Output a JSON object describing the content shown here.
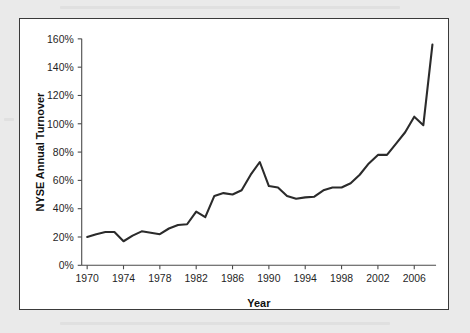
{
  "figure": {
    "background_color": "#ffffff",
    "page_background_color": "#eaeaea",
    "border_color": "#3a3a3a"
  },
  "chart_data": {
    "type": "line",
    "title": "",
    "xlabel": "Year",
    "ylabel": "NYSE Annual Turnover",
    "xlim": [
      1969.4,
      2008.4
    ],
    "ylim": [
      0,
      160
    ],
    "grid": false,
    "legend": null,
    "series_color": "#2b2b2b",
    "series_width": 2.1,
    "y_ticks": [
      0,
      20,
      40,
      60,
      80,
      100,
      120,
      140,
      160
    ],
    "y_tick_labels": [
      "0%",
      "20%",
      "40%",
      "60%",
      "80%",
      "100%",
      "120%",
      "140%",
      "160%"
    ],
    "x_ticks": [
      1970,
      1974,
      1978,
      1982,
      1986,
      1990,
      1994,
      1998,
      2002,
      2006
    ],
    "x_tick_labels": [
      "1970",
      "1974",
      "1978",
      "1982",
      "1986",
      "1990",
      "1994",
      "1998",
      "2002",
      "2006"
    ],
    "x": [
      1970,
      1971,
      1972,
      1973,
      1974,
      1975,
      1976,
      1977,
      1978,
      1979,
      1980,
      1981,
      1982,
      1983,
      1984,
      1985,
      1986,
      1987,
      1988,
      1989,
      1990,
      1991,
      1992,
      1993,
      1994,
      1995,
      1996,
      1997,
      1998,
      1999,
      2000,
      2001,
      2002,
      2003,
      2004,
      2005,
      2006,
      2007,
      2008
    ],
    "values": [
      20,
      22,
      23.5,
      23.5,
      17,
      21,
      24,
      23,
      22,
      26,
      28.5,
      29,
      38,
      34,
      49,
      51,
      50,
      53,
      64,
      73,
      56,
      55,
      49,
      47,
      48,
      48.5,
      53,
      55,
      55,
      58,
      64,
      72,
      78,
      78,
      86,
      94,
      105,
      99,
      156
    ],
    "series": [
      {
        "name": "NYSE Annual Turnover",
        "values": [
          20,
          22,
          23.5,
          23.5,
          17,
          21,
          24,
          23,
          22,
          26,
          28.5,
          29,
          38,
          34,
          49,
          51,
          50,
          53,
          64,
          73,
          56,
          55,
          49,
          47,
          48,
          48.5,
          53,
          55,
          55,
          58,
          64,
          72,
          78,
          78,
          86,
          94,
          105,
          99,
          156
        ]
      }
    ],
    "annotations": []
  }
}
